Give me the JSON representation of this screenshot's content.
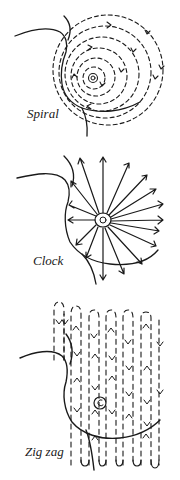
{
  "figure": {
    "ink_color": "#1a1a1a",
    "background_color": "#ffffff",
    "panels": [
      {
        "id": "spiral",
        "label": "Spiral",
        "pattern": "concentric dashed circles with arrows spiraling around nipple"
      },
      {
        "id": "clock",
        "label": "Clock",
        "pattern": "arrows radiating outward from nipple like clock hands"
      },
      {
        "id": "zigzag",
        "label": "Zig zag",
        "pattern": "vertical dashed strips moving up and down across breast"
      }
    ]
  }
}
